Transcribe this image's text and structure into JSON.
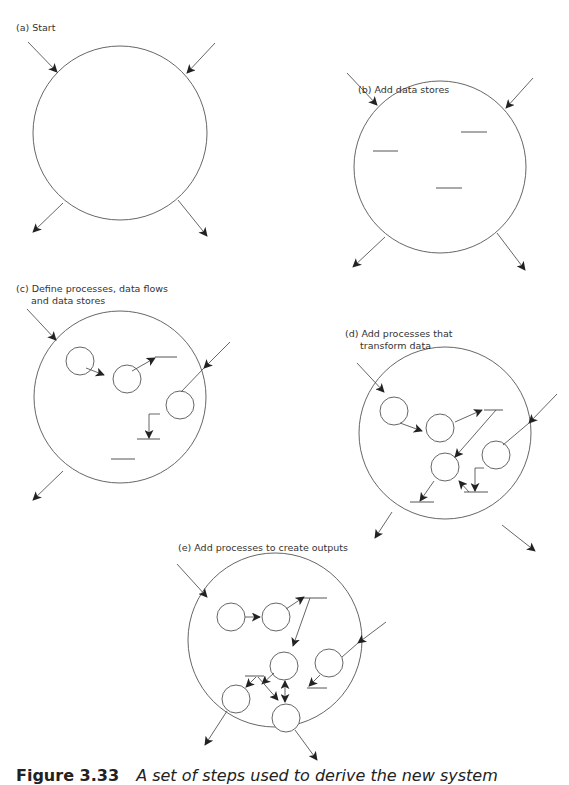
{
  "figure": {
    "number": "Figure 3.33",
    "caption": "A set of steps used to derive the new system"
  },
  "panels": [
    {
      "id": "a",
      "label_lines": [
        "(a) Start"
      ],
      "boundary": {
        "cx": 120,
        "cy": 133,
        "r": 87
      },
      "processes": [],
      "data_stores": [],
      "flows": [
        {
          "x1": 28,
          "y1": 42,
          "x2": 57,
          "y2": 72
        },
        {
          "x1": 215,
          "y1": 43,
          "x2": 187,
          "y2": 73
        },
        {
          "x1": 63,
          "y1": 203,
          "x2": 33,
          "y2": 232
        },
        {
          "x1": 178,
          "y1": 200,
          "x2": 207,
          "y2": 236
        }
      ]
    },
    {
      "id": "b",
      "label_lines": [
        "(b) Add data stores"
      ],
      "boundary": {
        "cx": 440,
        "cy": 167,
        "r": 86
      },
      "processes": [],
      "data_stores": [
        {
          "x1": 373,
          "x2": 398,
          "y": 151
        },
        {
          "x1": 461,
          "x2": 487,
          "y": 132
        },
        {
          "x1": 436,
          "x2": 462,
          "y": 188
        }
      ],
      "flows": [
        {
          "x1": 347,
          "y1": 73,
          "x2": 377,
          "y2": 105
        },
        {
          "x1": 533,
          "y1": 78,
          "x2": 506,
          "y2": 108
        },
        {
          "x1": 385,
          "y1": 237,
          "x2": 353,
          "y2": 267
        },
        {
          "x1": 497,
          "y1": 233,
          "x2": 525,
          "y2": 270
        }
      ]
    },
    {
      "id": "c",
      "label_lines": [
        "(c) Define processes, data flows",
        "and data stores"
      ],
      "boundary": {
        "cx": 120,
        "cy": 397,
        "r": 86
      },
      "processes": [
        {
          "cx": 80,
          "cy": 361,
          "r": 14
        },
        {
          "cx": 127,
          "cy": 379,
          "r": 14
        },
        {
          "cx": 180,
          "cy": 405,
          "r": 14
        }
      ],
      "data_stores": [
        {
          "x1": 155,
          "x2": 177,
          "y": 357
        },
        {
          "x1": 137,
          "x2": 160,
          "y": 439
        },
        {
          "x1": 111,
          "x2": 135,
          "y": 459
        }
      ],
      "flows": [
        {
          "x1": 27,
          "y1": 309,
          "x2": 56,
          "y2": 340
        },
        {
          "x1": 86,
          "y1": 368,
          "x2": 104,
          "y2": 375
        },
        {
          "x1": 132,
          "y1": 371,
          "x2": 155,
          "y2": 358
        },
        {
          "x1": 230,
          "y1": 342,
          "x2": 204,
          "y2": 368
        },
        {
          "x1": 204,
          "y1": 368,
          "x2": 181,
          "y2": 392,
          "arrow": false
        },
        {
          "points": [
            [
              160,
              414
            ],
            [
              149,
              414
            ],
            [
              149,
              438
            ]
          ]
        },
        {
          "x1": 63,
          "y1": 471,
          "x2": 33,
          "y2": 500
        }
      ]
    },
    {
      "id": "d",
      "label_lines": [
        "(d) Add processes that",
        "transform data"
      ],
      "boundary": {
        "cx": 445,
        "cy": 433,
        "r": 86
      },
      "processes": [
        {
          "cx": 394,
          "cy": 411,
          "r": 14
        },
        {
          "cx": 440,
          "cy": 428,
          "r": 14
        },
        {
          "cx": 445,
          "cy": 467,
          "r": 14
        },
        {
          "cx": 496,
          "cy": 455,
          "r": 14
        }
      ],
      "data_stores": [
        {
          "x1": 484,
          "x2": 503,
          "y": 410
        },
        {
          "x1": 464,
          "x2": 488,
          "y": 492
        },
        {
          "x1": 410,
          "x2": 434,
          "y": 502
        }
      ],
      "flows": [
        {
          "x1": 357,
          "y1": 363,
          "x2": 384,
          "y2": 392
        },
        {
          "x1": 400,
          "y1": 423,
          "x2": 422,
          "y2": 431
        },
        {
          "x1": 455,
          "y1": 422,
          "x2": 482,
          "y2": 410
        },
        {
          "x1": 496,
          "y1": 410,
          "x2": 455,
          "y2": 457
        },
        {
          "x1": 557,
          "y1": 394,
          "x2": 529,
          "y2": 423
        },
        {
          "x1": 529,
          "y1": 423,
          "x2": 503,
          "y2": 445,
          "arrow": false
        },
        {
          "points": [
            [
              484,
              468
            ],
            [
              475,
              468
            ],
            [
              475,
              491
            ]
          ]
        },
        {
          "x1": 469,
          "y1": 492,
          "x2": 459,
          "y2": 481
        },
        {
          "x1": 434,
          "y1": 481,
          "x2": 420,
          "y2": 501
        },
        {
          "x1": 392,
          "y1": 512,
          "x2": 375,
          "y2": 538
        },
        {
          "x1": 502,
          "y1": 525,
          "x2": 535,
          "y2": 551
        }
      ]
    },
    {
      "id": "e",
      "label_lines": [
        "(e) Add processes to create outputs"
      ],
      "boundary": {
        "cx": 275,
        "cy": 640,
        "r": 87
      },
      "processes": [
        {
          "cx": 231,
          "cy": 617,
          "r": 14
        },
        {
          "cx": 276,
          "cy": 617,
          "r": 14
        },
        {
          "cx": 284,
          "cy": 666,
          "r": 14
        },
        {
          "cx": 329,
          "cy": 663,
          "r": 14
        },
        {
          "cx": 236,
          "cy": 699,
          "r": 14
        },
        {
          "cx": 286,
          "cy": 718,
          "r": 14
        }
      ],
      "data_stores": [
        {
          "x1": 302,
          "x2": 327,
          "y": 598
        },
        {
          "x1": 245,
          "x2": 264,
          "y": 676
        },
        {
          "x1": 307,
          "y": 688,
          "x2": 327
        }
      ],
      "flows": [
        {
          "x1": 177,
          "y1": 564,
          "x2": 207,
          "y2": 597
        },
        {
          "x1": 245,
          "y1": 617,
          "x2": 260,
          "y2": 617
        },
        {
          "x1": 286,
          "y1": 609,
          "x2": 304,
          "y2": 597
        },
        {
          "x1": 310,
          "y1": 598,
          "x2": 293,
          "y2": 646
        },
        {
          "x1": 274,
          "y1": 673,
          "x2": 262,
          "y2": 684
        },
        {
          "x1": 256,
          "y1": 677,
          "x2": 246,
          "y2": 687
        },
        {
          "x1": 258,
          "y1": 677,
          "x2": 278,
          "y2": 700
        },
        {
          "x1": 285,
          "y1": 681,
          "x2": 285,
          "y2": 702,
          "double": true
        },
        {
          "x1": 386,
          "y1": 622,
          "x2": 358,
          "y2": 643
        },
        {
          "x1": 358,
          "y1": 643,
          "x2": 342,
          "y2": 657,
          "arrow": false
        },
        {
          "x1": 320,
          "y1": 675,
          "x2": 309,
          "y2": 686
        },
        {
          "x1": 227,
          "y1": 711,
          "x2": 205,
          "y2": 745
        },
        {
          "x1": 295,
          "y1": 730,
          "x2": 317,
          "y2": 760
        }
      ]
    }
  ],
  "colors": {
    "stroke": "#555555",
    "arrowhead": "#222222",
    "text": "#333333"
  }
}
